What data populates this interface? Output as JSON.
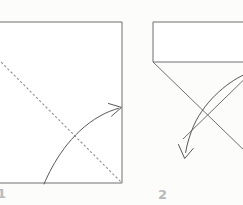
{
  "figure": {
    "kind": "origami-fold-instruction-diagram",
    "background_color": "#fcfcfb",
    "line_color": "#6e6e6e",
    "fold_line_color": "#8c8c8c",
    "arrow_color": "#555555",
    "label_color": "#b9b9b9",
    "paper_fill": "#ffffff"
  },
  "steps": [
    {
      "number": "1",
      "caption": "",
      "shape": "square sheet, partly cropped at left edge",
      "fold_line": "dotted diagonal from upper-left to lower-right corner",
      "arrow": "curved arrow from bottom edge sweeping up to the right edge"
    },
    {
      "number": "2",
      "caption": "",
      "shape": "rectangle on top with a downward V (triangle flaps) below",
      "fold_line": "none",
      "arrow": "curved arrow from upper right sweeping down to the lower left"
    }
  ],
  "panel_1": {
    "label": "1",
    "square": {
      "x": 0,
      "y": 22,
      "width": 122,
      "height": 161
    },
    "dotted_diagonal": {
      "x1": 0,
      "y1": 60,
      "x2": 122,
      "y2": 183
    },
    "arrow_path": "M 44 183 C 60 160, 80 130, 119 108",
    "arrow_tip": {
      "x": 122,
      "y": 107
    }
  },
  "panel_2": {
    "label": "2",
    "rectangle": {
      "x": 153,
      "y": 22,
      "width": 90,
      "height": 40
    },
    "v_left": {
      "x1": 153,
      "y1": 62,
      "x2": 243,
      "y2": 149
    },
    "v_right": {
      "x1": 243,
      "y1": 62,
      "x2": 185,
      "y2": 143
    },
    "arrow_path": "M 243 78 C 225 85, 200 110, 186 152",
    "arrow_tip": {
      "x": 185,
      "y": 158
    }
  }
}
